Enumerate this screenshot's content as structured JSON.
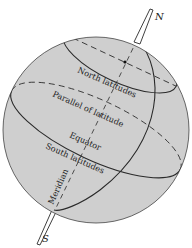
{
  "diagram": {
    "colors": {
      "globe_fill": "#cfcfcf",
      "stroke": "#2a2a2a",
      "background": "#ffffff"
    },
    "poles": {
      "north": "N",
      "south": "S"
    },
    "labels": {
      "north_latitudes": "North latitudes",
      "parallel_of_latitude": "Parallel of latitude",
      "equator": "Equator",
      "south_latitudes": "South latitudes",
      "meridian": "Meridian"
    }
  }
}
